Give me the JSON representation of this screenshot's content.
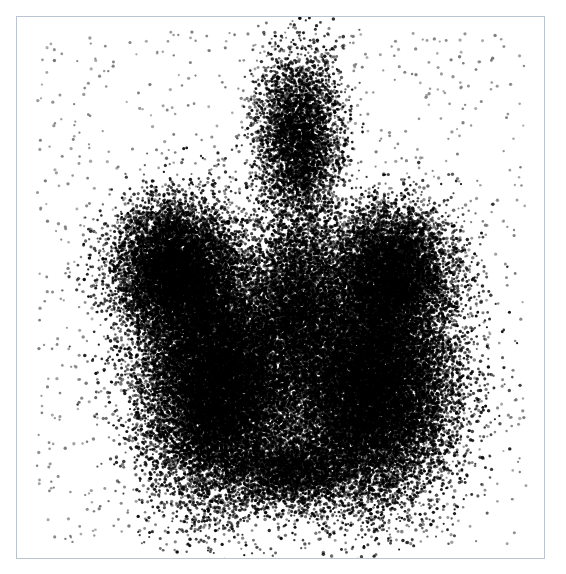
{
  "image": {
    "subject": "thyroid-scintigram",
    "description": "Stippled grayscale nuclear-medicine thyroid scan showing left and right lobes with a pyramidal lobe",
    "frame": {
      "x": 16,
      "y": 16,
      "width": 529,
      "height": 543,
      "border_color": "#b9c6d2"
    },
    "colors": {
      "background": "#ffffff",
      "dot": "#000000",
      "noise_dot": "#6b6b6b"
    },
    "regions": [
      {
        "name": "pyramidal-lobe",
        "cx": 298,
        "cy": 140,
        "rx": 42,
        "ry": 88,
        "density": 0.55
      },
      {
        "name": "left-lobe-upper",
        "cx": 175,
        "cy": 270,
        "rx": 62,
        "ry": 70,
        "density": 0.95
      },
      {
        "name": "left-lobe-lower",
        "cx": 220,
        "cy": 380,
        "rx": 78,
        "ry": 115,
        "density": 1.0
      },
      {
        "name": "right-lobe-upper",
        "cx": 390,
        "cy": 270,
        "rx": 60,
        "ry": 65,
        "density": 0.85
      },
      {
        "name": "right-lobe-lower",
        "cx": 370,
        "cy": 385,
        "rx": 82,
        "ry": 110,
        "density": 1.0
      },
      {
        "name": "isthmus",
        "cx": 298,
        "cy": 300,
        "rx": 45,
        "ry": 85,
        "density": 0.5
      },
      {
        "name": "lower-junction",
        "cx": 295,
        "cy": 470,
        "rx": 60,
        "ry": 35,
        "density": 0.55
      }
    ],
    "background_noise_dots": 1100,
    "body_dots": 62000,
    "seed": 20240517
  }
}
